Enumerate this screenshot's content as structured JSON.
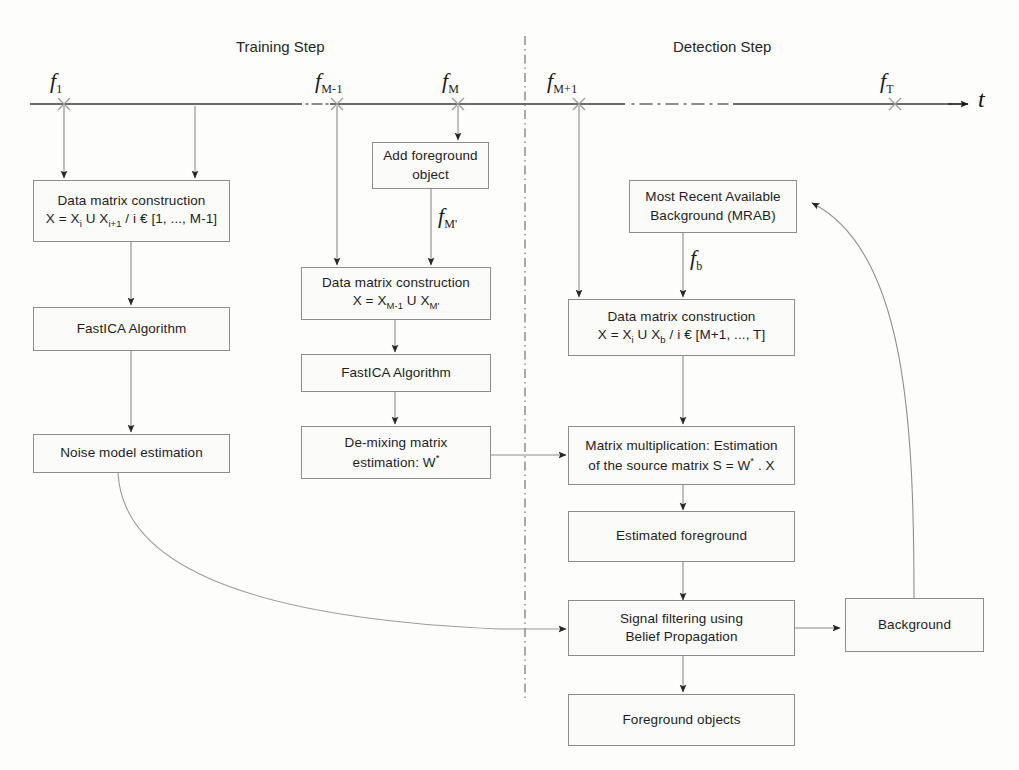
{
  "diagram": {
    "title_axis": "t",
    "phases": [
      {
        "name": "training-step",
        "label": "Training Step"
      },
      {
        "name": "detection-step",
        "label": "Detection Step"
      }
    ],
    "frames": [
      {
        "name": "f1",
        "base": "f",
        "sub": "1"
      },
      {
        "name": "fM-1",
        "base": "f",
        "sub": "M-1"
      },
      {
        "name": "fM",
        "base": "f",
        "sub": "M"
      },
      {
        "name": "fM+1",
        "base": "f",
        "sub": "M+1"
      },
      {
        "name": "fT",
        "base": "f",
        "sub": "T"
      },
      {
        "name": "fM'",
        "base": "f",
        "sub": "M'"
      },
      {
        "name": "fb",
        "base": "f",
        "sub": "b"
      }
    ],
    "boxes": {
      "train_data_matrix": {
        "line1": "Data matrix construction",
        "line2_pre": "X = X",
        "line2_sub1": "i",
        "line2_mid": " U X",
        "line2_sub2": "i+1",
        "line2_post": " / i € [1, ..., M-1]"
      },
      "train_fastica": {
        "line1": "FastICA Algorithm"
      },
      "train_noise": {
        "line1": "Noise model estimation"
      },
      "add_foreground": {
        "line1": "Add foreground",
        "line2": "object"
      },
      "mid_data_matrix": {
        "line1": "Data matrix construction",
        "line2_pre": "X = X",
        "line2_sub1": "M-1",
        "line2_mid": " U X",
        "line2_sub2": "M'",
        "line2_post": ""
      },
      "mid_fastica": {
        "line1": "FastICA Algorithm"
      },
      "demixing": {
        "line1": "De-mixing matrix",
        "line2": "estimation: W",
        "line2_sup": "*"
      },
      "mrab": {
        "line1": "Most Recent Available",
        "line2": "Background (MRAB)"
      },
      "det_data_matrix": {
        "line1": "Data matrix construction",
        "line2_pre": "X = X",
        "line2_sub1": "i",
        "line2_mid": " U X",
        "line2_sub2": "b",
        "line2_post": " / i € [M+1, ..., T]"
      },
      "matrix_mult": {
        "line1": "Matrix multiplication: Estimation",
        "line2_pre": "of the source matrix S = W",
        "line2_sup": "*",
        "line2_post": " . X"
      },
      "estimated_foreground": {
        "line1": "Estimated foreground"
      },
      "signal_filtering": {
        "line1": "Signal filtering using",
        "line2": "Belief Propagation"
      },
      "foreground_objects": {
        "line1": "Foreground objects"
      },
      "background": {
        "line1": "Background"
      }
    },
    "colors": {
      "stroke": "#8d8d8d",
      "arrow": "#6f6f6f",
      "text": "#1d1d1d",
      "timeline": "#3a3a3a",
      "divider": "#707070",
      "box_fill": "#fbfbfa"
    }
  }
}
